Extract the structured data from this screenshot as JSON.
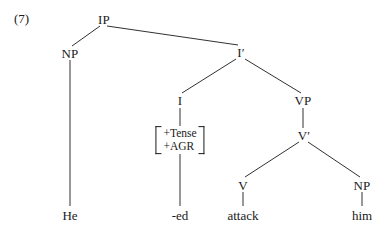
{
  "figure": {
    "example_number": "(7)",
    "type": "x-bar syntax tree",
    "sentence": "He -ed attack him",
    "background_color": "#ffffff",
    "ink_color": "#1a1a1a"
  },
  "nodes": {
    "ip": "IP",
    "np_subject": "NP",
    "i_bar": "I′",
    "i_head": "I",
    "vp": "VP",
    "v_bar": "V′",
    "v_head": "V",
    "np_object": "NP"
  },
  "feature_matrix": {
    "row1": "+Tense",
    "row2": "+AGR",
    "left_bracket": "[",
    "right_bracket": "]"
  },
  "terminals": {
    "subject": "He",
    "inflection": "-ed",
    "verb": "attack",
    "object": "him"
  }
}
